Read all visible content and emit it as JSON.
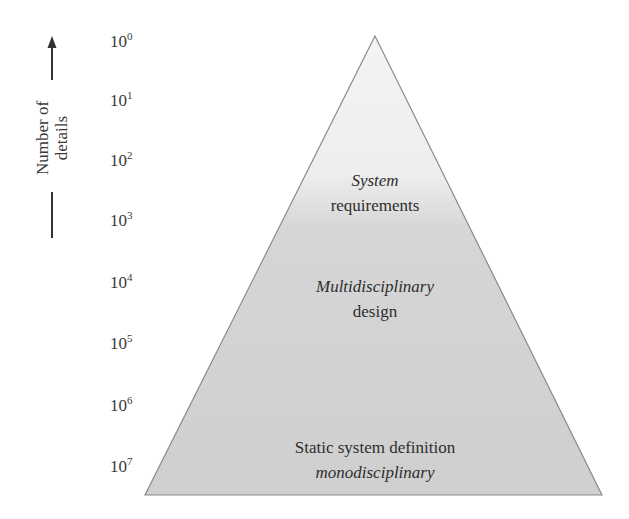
{
  "diagram": {
    "type": "pyramid",
    "axis": {
      "label_line1": "Number of",
      "label_line2": "details",
      "direction": "up",
      "ticks": [
        {
          "base": "10",
          "exp": "0"
        },
        {
          "base": "10",
          "exp": "1"
        },
        {
          "base": "10",
          "exp": "2"
        },
        {
          "base": "10",
          "exp": "3"
        },
        {
          "base": "10",
          "exp": "4"
        },
        {
          "base": "10",
          "exp": "5"
        },
        {
          "base": "10",
          "exp": "6"
        },
        {
          "base": "10",
          "exp": "7"
        }
      ]
    },
    "levels": [
      {
        "line1": "System",
        "line1_style": "italic",
        "line2": "requirements",
        "line2_style": "normal"
      },
      {
        "line1": "Multidisciplinary",
        "line1_style": "italic",
        "line2": "design",
        "line2_style": "normal"
      },
      {
        "line1": "Static system definition",
        "line1_style": "normal",
        "line2": "monodisciplinary",
        "line2_style": "italic"
      }
    ],
    "colors": {
      "fill_top": "#f4f4f4",
      "fill_bottom": "#cfcfcf",
      "outline": "#8a8a8a",
      "text": "#2e2e2e",
      "arrow": "#333333"
    }
  }
}
